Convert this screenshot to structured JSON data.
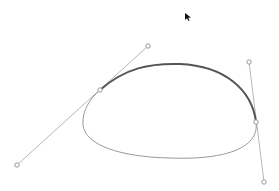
{
  "canvas": {
    "background": "#ffffff",
    "width": 279,
    "height": 191
  },
  "bezier_editor": {
    "selected_segment_color": "#555555",
    "path_color": "#9a9a9a",
    "handle_color": "#b8b8b8",
    "anchors": [
      {
        "name": "anchor-left",
        "x": 100,
        "y": 90
      },
      {
        "name": "anchor-right",
        "x": 256,
        "y": 122
      }
    ],
    "handles": [
      {
        "name": "handle-left-out",
        "x": 148,
        "y": 46
      },
      {
        "name": "handle-left-in",
        "x": 17,
        "y": 165
      },
      {
        "name": "handle-right-in",
        "x": 249,
        "y": 62
      },
      {
        "name": "handle-right-out",
        "x": 264,
        "y": 182
      }
    ]
  },
  "cursor": {
    "icon": "arrow-pointer-icon",
    "x": 185,
    "y": 14
  }
}
